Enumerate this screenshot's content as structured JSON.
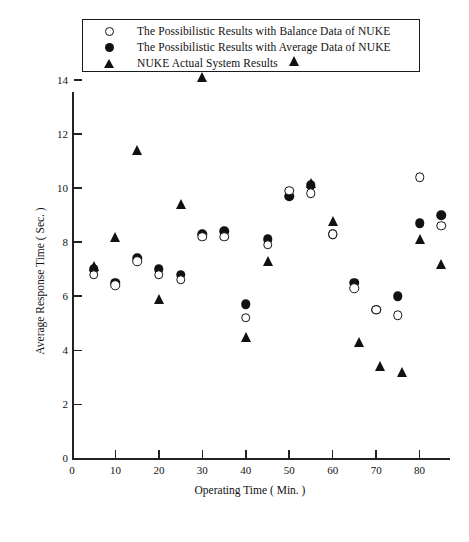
{
  "legend": {
    "items": [
      {
        "marker": "open-circle-icon",
        "label": "The Possibilistic Results with Balance Data of NUKE"
      },
      {
        "marker": "filled-circle-icon",
        "label": "The Possibilistic Results with Average Data of NUKE"
      },
      {
        "marker": "filled-triangle-icon",
        "label": "NUKE Actual System Results"
      }
    ]
  },
  "chart_data": {
    "type": "scatter",
    "title": "",
    "xlabel": "Operating Time ( Min. )",
    "ylabel": "Average Response Time ( Sec. )",
    "xlim": [
      0,
      87
    ],
    "ylim": [
      0,
      15
    ],
    "xticks": [
      0,
      10,
      20,
      30,
      40,
      50,
      60,
      70,
      80
    ],
    "yticks": [
      0,
      2,
      4,
      6,
      8,
      10,
      12,
      14
    ],
    "xtick_labels": [
      "0",
      "10",
      "20",
      "30",
      "40",
      "50",
      "60",
      "70",
      "80"
    ],
    "ytick_labels": [
      "0",
      "2",
      "4",
      "6",
      "8",
      "10",
      "12",
      "14"
    ],
    "grid": false,
    "legend_position": "above-plot",
    "series": [
      {
        "name": "The Possibilistic Results with Balance Data of NUKE",
        "marker": "open-circle",
        "points": [
          {
            "x": 5,
            "y": 6.8
          },
          {
            "x": 10,
            "y": 6.4
          },
          {
            "x": 15,
            "y": 7.3
          },
          {
            "x": 20,
            "y": 6.8
          },
          {
            "x": 25,
            "y": 6.6
          },
          {
            "x": 30,
            "y": 8.2
          },
          {
            "x": 35,
            "y": 8.2
          },
          {
            "x": 40,
            "y": 5.2
          },
          {
            "x": 45,
            "y": 7.9
          },
          {
            "x": 50,
            "y": 9.9
          },
          {
            "x": 55,
            "y": 9.8
          },
          {
            "x": 60,
            "y": 8.3
          },
          {
            "x": 65,
            "y": 6.3
          },
          {
            "x": 70,
            "y": 5.5
          },
          {
            "x": 75,
            "y": 5.3
          },
          {
            "x": 80,
            "y": 10.4
          },
          {
            "x": 85,
            "y": 8.6
          }
        ]
      },
      {
        "name": "The Possibilistic Results with Average Data of NUKE",
        "marker": "filled-circle",
        "points": [
          {
            "x": 5,
            "y": 7.0
          },
          {
            "x": 10,
            "y": 6.5
          },
          {
            "x": 15,
            "y": 7.4
          },
          {
            "x": 20,
            "y": 7.0
          },
          {
            "x": 25,
            "y": 6.8
          },
          {
            "x": 30,
            "y": 8.3
          },
          {
            "x": 35,
            "y": 8.4
          },
          {
            "x": 40,
            "y": 5.7
          },
          {
            "x": 45,
            "y": 8.1
          },
          {
            "x": 50,
            "y": 9.7
          },
          {
            "x": 55,
            "y": 10.1
          },
          {
            "x": 60,
            "y": 8.3
          },
          {
            "x": 65,
            "y": 6.5
          },
          {
            "x": 70,
            "y": 5.5
          },
          {
            "x": 75,
            "y": 6.0
          },
          {
            "x": 80,
            "y": 8.7
          },
          {
            "x": 85,
            "y": 9.0
          }
        ]
      },
      {
        "name": "NUKE Actual System Results",
        "marker": "filled-triangle",
        "points": [
          {
            "x": 5,
            "y": 7.1
          },
          {
            "x": 10,
            "y": 8.2
          },
          {
            "x": 15,
            "y": 11.4
          },
          {
            "x": 20,
            "y": 5.9
          },
          {
            "x": 25,
            "y": 9.4
          },
          {
            "x": 30,
            "y": 14.1
          },
          {
            "x": 40,
            "y": 4.5
          },
          {
            "x": 45,
            "y": 7.3
          },
          {
            "x": 51,
            "y": 14.7
          },
          {
            "x": 55,
            "y": 10.2
          },
          {
            "x": 60,
            "y": 8.8
          },
          {
            "x": 66,
            "y": 4.3
          },
          {
            "x": 71,
            "y": 3.4
          },
          {
            "x": 76,
            "y": 3.2
          },
          {
            "x": 80,
            "y": 8.1
          },
          {
            "x": 85,
            "y": 7.2
          }
        ]
      }
    ]
  }
}
